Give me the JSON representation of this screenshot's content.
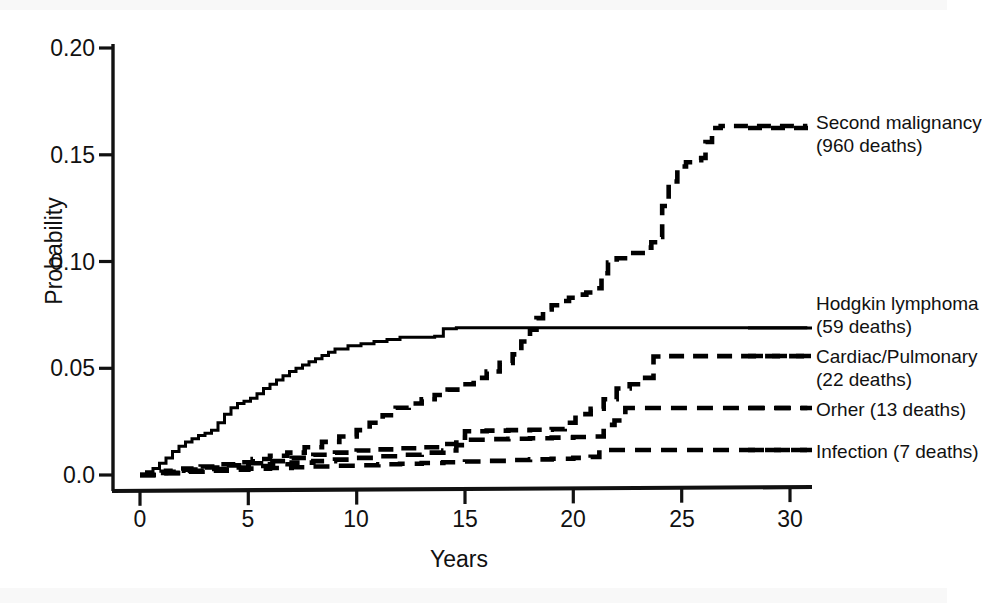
{
  "chart_data": {
    "type": "line",
    "subtype": "step",
    "title": "",
    "xlabel": "Years",
    "ylabel": "Probability",
    "xlim": [
      -0.4,
      31.0
    ],
    "ylim": [
      0.0,
      0.208
    ],
    "xticks": [
      0,
      5,
      10,
      15,
      20,
      25,
      30
    ],
    "xtick_labels": [
      "0",
      "5",
      "10",
      "15",
      "20",
      "25",
      "30"
    ],
    "yticks": [
      0.0,
      0.05,
      0.1,
      0.15,
      0.2
    ],
    "ytick_labels": [
      "0.0",
      "0.05",
      "0.10",
      "0.15",
      "0.20"
    ],
    "grid": false,
    "legend_position": "right-of-plot, inline at curve ends",
    "series": [
      {
        "name": "Second malignancy",
        "label": "Second malignancy",
        "deaths": "960 deaths",
        "label_line2": "(960 deaths)",
        "style": "dashed",
        "color": "#000000",
        "points": [
          [
            0.0,
            0.0
          ],
          [
            0.6,
            0.001
          ],
          [
            1.2,
            0.002
          ],
          [
            2.0,
            0.003
          ],
          [
            2.8,
            0.004
          ],
          [
            3.6,
            0.005
          ],
          [
            4.4,
            0.006
          ],
          [
            5.2,
            0.0075
          ],
          [
            6.0,
            0.009
          ],
          [
            6.8,
            0.0105
          ],
          [
            7.6,
            0.013
          ],
          [
            8.4,
            0.0155
          ],
          [
            9.2,
            0.018
          ],
          [
            10.0,
            0.021
          ],
          [
            10.6,
            0.0245
          ],
          [
            11.2,
            0.028
          ],
          [
            11.8,
            0.0315
          ],
          [
            12.4,
            0.0335
          ],
          [
            13.0,
            0.0355
          ],
          [
            13.6,
            0.0375
          ],
          [
            14.2,
            0.04
          ],
          [
            14.8,
            0.0425
          ],
          [
            15.4,
            0.0455
          ],
          [
            16.0,
            0.0485
          ],
          [
            16.6,
            0.0525
          ],
          [
            17.2,
            0.0565
          ],
          [
            17.6,
            0.0625
          ],
          [
            18.0,
            0.068
          ],
          [
            18.3,
            0.0735
          ],
          [
            18.6,
            0.0775
          ],
          [
            19.0,
            0.0795
          ],
          [
            19.4,
            0.0815
          ],
          [
            19.8,
            0.083
          ],
          [
            20.2,
            0.0845
          ],
          [
            20.6,
            0.0855
          ],
          [
            21.0,
            0.0875
          ],
          [
            21.3,
            0.0945
          ],
          [
            21.6,
            0.0995
          ],
          [
            22.0,
            0.1015
          ],
          [
            22.6,
            0.104
          ],
          [
            23.2,
            0.1065
          ],
          [
            23.6,
            0.109
          ],
          [
            23.9,
            0.1115
          ],
          [
            24.1,
            0.126
          ],
          [
            24.4,
            0.1375
          ],
          [
            24.8,
            0.1445
          ],
          [
            25.2,
            0.1465
          ],
          [
            25.6,
            0.1475
          ],
          [
            25.9,
            0.1485
          ],
          [
            26.1,
            0.156
          ],
          [
            26.4,
            0.1625
          ],
          [
            26.8,
            0.1635
          ],
          [
            30.8,
            0.1635
          ]
        ]
      },
      {
        "name": "Hodgkin lymphoma",
        "label": "Hodgkin lymphoma",
        "deaths": "59 deaths",
        "label_line2": "(59 deaths)",
        "style": "solid",
        "color": "#000000",
        "points": [
          [
            0.0,
            0.0
          ],
          [
            0.3,
            0.0015
          ],
          [
            0.6,
            0.003
          ],
          [
            0.9,
            0.0055
          ],
          [
            1.2,
            0.008
          ],
          [
            1.5,
            0.011
          ],
          [
            1.8,
            0.0135
          ],
          [
            2.1,
            0.0155
          ],
          [
            2.4,
            0.017
          ],
          [
            2.7,
            0.0185
          ],
          [
            3.0,
            0.0195
          ],
          [
            3.3,
            0.021
          ],
          [
            3.6,
            0.0245
          ],
          [
            3.9,
            0.0285
          ],
          [
            4.2,
            0.0315
          ],
          [
            4.5,
            0.0335
          ],
          [
            4.8,
            0.0345
          ],
          [
            5.1,
            0.036
          ],
          [
            5.4,
            0.038
          ],
          [
            5.7,
            0.0405
          ],
          [
            6.0,
            0.0425
          ],
          [
            6.3,
            0.0445
          ],
          [
            6.6,
            0.0465
          ],
          [
            6.9,
            0.0485
          ],
          [
            7.2,
            0.05
          ],
          [
            7.5,
            0.0515
          ],
          [
            7.8,
            0.053
          ],
          [
            8.1,
            0.0545
          ],
          [
            8.4,
            0.056
          ],
          [
            8.7,
            0.0575
          ],
          [
            9.0,
            0.059
          ],
          [
            9.6,
            0.0605
          ],
          [
            10.2,
            0.0615
          ],
          [
            10.8,
            0.0625
          ],
          [
            11.4,
            0.0635
          ],
          [
            12.0,
            0.0645
          ],
          [
            13.0,
            0.0645
          ],
          [
            13.6,
            0.065
          ],
          [
            14.0,
            0.0685
          ],
          [
            14.6,
            0.069
          ],
          [
            30.8,
            0.069
          ]
        ]
      },
      {
        "name": "Cardiac/Pulmonary",
        "label": "Cardiac/Pulmonary",
        "deaths": "22 deaths",
        "label_line2": "(22 deaths)",
        "style": "dashed",
        "color": "#000000",
        "points": [
          [
            0.0,
            0.0
          ],
          [
            1.0,
            0.0015
          ],
          [
            2.0,
            0.0025
          ],
          [
            3.0,
            0.0035
          ],
          [
            4.0,
            0.0045
          ],
          [
            5.0,
            0.0055
          ],
          [
            6.0,
            0.0065
          ],
          [
            7.0,
            0.008
          ],
          [
            8.0,
            0.0095
          ],
          [
            9.0,
            0.0105
          ],
          [
            10.0,
            0.0115
          ],
          [
            11.0,
            0.012
          ],
          [
            12.0,
            0.0125
          ],
          [
            13.0,
            0.013
          ],
          [
            14.0,
            0.0145
          ],
          [
            14.6,
            0.0175
          ],
          [
            15.0,
            0.0205
          ],
          [
            16.0,
            0.0208
          ],
          [
            17.0,
            0.021
          ],
          [
            18.0,
            0.0212
          ],
          [
            19.0,
            0.0215
          ],
          [
            19.6,
            0.0245
          ],
          [
            20.1,
            0.0285
          ],
          [
            20.8,
            0.031
          ],
          [
            21.4,
            0.0355
          ],
          [
            22.0,
            0.0405
          ],
          [
            22.6,
            0.0425
          ],
          [
            23.2,
            0.0455
          ],
          [
            23.7,
            0.0555
          ],
          [
            24.2,
            0.0557
          ],
          [
            30.8,
            0.0557
          ]
        ]
      },
      {
        "name": "Orher",
        "label": "Orher (13 deaths)",
        "deaths": "13 deaths",
        "style": "dashed",
        "color": "#000000",
        "points": [
          [
            0.0,
            0.0
          ],
          [
            1.0,
            0.001
          ],
          [
            2.0,
            0.002
          ],
          [
            3.0,
            0.0028
          ],
          [
            4.0,
            0.0035
          ],
          [
            5.0,
            0.0042
          ],
          [
            6.0,
            0.005
          ],
          [
            7.0,
            0.0058
          ],
          [
            8.0,
            0.0065
          ],
          [
            9.0,
            0.0072
          ],
          [
            10.0,
            0.008
          ],
          [
            11.0,
            0.0088
          ],
          [
            12.0,
            0.0095
          ],
          [
            13.0,
            0.0105
          ],
          [
            14.0,
            0.0115
          ],
          [
            14.6,
            0.014
          ],
          [
            15.0,
            0.0165
          ],
          [
            16.0,
            0.0168
          ],
          [
            17.0,
            0.017
          ],
          [
            18.0,
            0.0172
          ],
          [
            19.0,
            0.0175
          ],
          [
            20.0,
            0.0178
          ],
          [
            21.0,
            0.018
          ],
          [
            21.4,
            0.0235
          ],
          [
            21.9,
            0.0255
          ],
          [
            22.4,
            0.0314
          ],
          [
            30.8,
            0.0314
          ]
        ]
      },
      {
        "name": "Infection",
        "label": "Infection (7 deaths)",
        "deaths": "7 deaths",
        "style": "dashed",
        "color": "#000000",
        "points": [
          [
            0.0,
            0.0
          ],
          [
            1.0,
            0.0008
          ],
          [
            2.0,
            0.0015
          ],
          [
            3.0,
            0.002
          ],
          [
            4.0,
            0.0025
          ],
          [
            5.0,
            0.003
          ],
          [
            6.0,
            0.0033
          ],
          [
            7.0,
            0.0036
          ],
          [
            8.0,
            0.004
          ],
          [
            9.0,
            0.0043
          ],
          [
            10.0,
            0.0046
          ],
          [
            11.0,
            0.005
          ],
          [
            12.0,
            0.0053
          ],
          [
            13.0,
            0.0056
          ],
          [
            14.0,
            0.006
          ],
          [
            15.0,
            0.0063
          ],
          [
            16.0,
            0.0066
          ],
          [
            17.0,
            0.007
          ],
          [
            18.0,
            0.0073
          ],
          [
            19.0,
            0.0076
          ],
          [
            20.0,
            0.008
          ],
          [
            20.8,
            0.0085
          ],
          [
            21.2,
            0.0117
          ],
          [
            30.8,
            0.0117
          ]
        ]
      }
    ]
  },
  "legend": {
    "entries": [
      {
        "line1": "Second malignancy",
        "line2": "(960 deaths)"
      },
      {
        "line1": "Hodgkin lymphoma",
        "line2": "(59 deaths)"
      },
      {
        "line1": "Cardiac/Pulmonary",
        "line2": "(22 deaths)"
      },
      {
        "line1": "Orher (13 deaths)",
        "line2": ""
      },
      {
        "line1": "Infection (7 deaths)",
        "line2": ""
      }
    ]
  },
  "axes": {
    "ylabel": "Probability",
    "xlabel": "Years",
    "ytick_labels": [
      "0.20",
      "0.15",
      "0.10",
      "0.05",
      "0.0"
    ],
    "xtick_labels": [
      "0",
      "5",
      "10",
      "15",
      "20",
      "25",
      "30"
    ]
  }
}
